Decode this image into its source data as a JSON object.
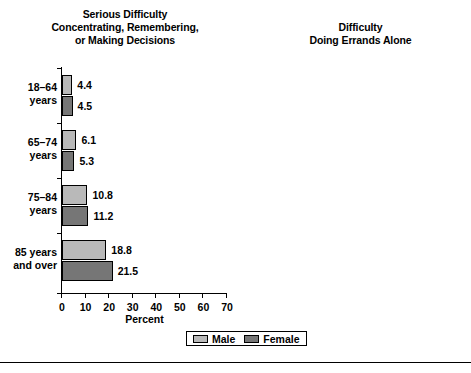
{
  "chart_data": {
    "type": "bar",
    "orientation": "horizontal",
    "title": "",
    "xlabel": "Percent",
    "ylabel": "",
    "xlim": [
      0,
      70
    ],
    "xticks": [
      "0",
      "10",
      "20",
      "30",
      "40",
      "50",
      "60",
      "70"
    ],
    "grid": false,
    "legend": {
      "position": "bottom-center",
      "entries": [
        {
          "name": "Male",
          "color": "#b9b9b9"
        },
        {
          "name": "Female",
          "color": "#767676"
        }
      ]
    },
    "categories": [
      "18–64\nyears",
      "65–74\nyears",
      "75–84\nyears",
      "85 years\nand over"
    ],
    "panels": [
      {
        "title": "Serious Difficulty\nConcentrating, Remembering,\nor Making Decisions",
        "title_lines": [
          "Serious Difficulty",
          "Concentrating, Remembering,",
          "or Making Decisions"
        ],
        "xlabel": "Percent",
        "series": [
          {
            "name": "Male",
            "values": [
              4.4,
              6.1,
              10.8,
              18.8
            ],
            "labels": [
              "4.4",
              "6.1",
              "10.8",
              "18.8"
            ]
          },
          {
            "name": "Female",
            "values": [
              4.5,
              5.3,
              11.2,
              21.5
            ],
            "labels": [
              "4.5",
              "5.3",
              "11.2",
              "21.5"
            ]
          }
        ]
      },
      {
        "title": "Difficulty\nDoing Errands Alone",
        "title_lines": [
          "Difficulty",
          "Doing Errands Alone"
        ],
        "xlabel": "Percent",
        "series": [
          {
            "name": "Male",
            "values": [
              3.1,
              6.4,
              12.9,
              26.2
            ],
            "labels": [
              "3.1",
              "6.4",
              "12.9",
              "26.2"
            ]
          },
          {
            "name": "Female",
            "values": [
              3.9,
              9.4,
              20.7,
              45.0
            ],
            "labels": [
              "3.9",
              "9.4",
              "20.7",
              "45.0"
            ]
          }
        ]
      }
    ]
  },
  "panel0": {
    "title_line1": "Serious Difficulty",
    "title_line2": "Concentrating, Remembering,",
    "title_line3": "or Making Decisions",
    "xlabel": "Percent"
  },
  "panel1": {
    "title_line1": "Difficulty",
    "title_line2": "Doing Errands Alone",
    "xlabel": "Percent"
  },
  "categories": [
    {
      "line1": "18–64",
      "line2": "years"
    },
    {
      "line1": "65–74",
      "line2": "years"
    },
    {
      "line1": "75–84",
      "line2": "years"
    },
    {
      "line1": "85 years",
      "line2": "and over"
    }
  ],
  "xticks": [
    "0",
    "10",
    "20",
    "30",
    "40",
    "50",
    "60",
    "70"
  ],
  "legend": {
    "male": "Male",
    "female": "Female"
  },
  "colors": {
    "male": "#b9b9b9",
    "female": "#767676",
    "axis": "#000000"
  }
}
